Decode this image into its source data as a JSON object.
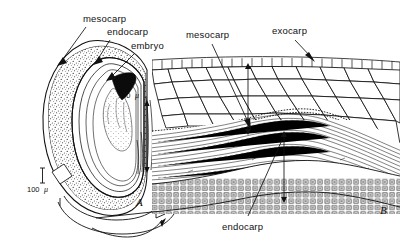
{
  "figure": {
    "type": "botanical-line-drawing",
    "background_color": "#ffffff",
    "ink_color": "#111111"
  },
  "panel_a": {
    "label": "A",
    "description": "Longitudinal section of whole fruit showing pericarp layers and embryo",
    "callouts": [
      {
        "id": "mesocarp",
        "label": "mesocarp"
      },
      {
        "id": "endocarp",
        "label": "endocarp"
      },
      {
        "id": "embryo",
        "label": "embryo"
      }
    ],
    "scale_bar": {
      "value": "100",
      "unit": "μ"
    }
  },
  "panel_b": {
    "label": "B",
    "description": "Enlarged detail of the pericarp showing exocarp, mesocarp parenchyma, fibrous zone and endocarp sclereids",
    "callouts": [
      {
        "id": "mesocarp",
        "label": "mesocarp"
      },
      {
        "id": "exocarp",
        "label": "exocarp"
      },
      {
        "id": "endocarp",
        "label": "endocarp"
      }
    ],
    "scale_bar": {
      "value": "100",
      "unit": "μ"
    }
  }
}
